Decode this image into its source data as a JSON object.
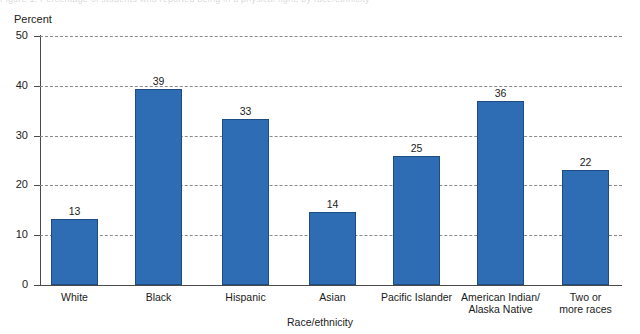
{
  "scan_artifact": {
    "text": "Figure 1.  Percentage of students who reported being in a physical fight, by race/ethnicity"
  },
  "chart_data": {
    "type": "bar",
    "title": "",
    "xlabel": "Race/ethnicity",
    "ylabel": "Percent",
    "ylim": [
      0,
      50
    ],
    "yticks": [
      0,
      10,
      20,
      30,
      40,
      50
    ],
    "ytick_labels": [
      "0",
      "10",
      "20",
      "30",
      "40",
      "50"
    ],
    "grid": "horizontal-dashed",
    "legend": "none",
    "bar_color": "#2e6db4",
    "bar_edge_color": "#1d4c82",
    "categories": [
      "White",
      "Black",
      "Hispanic",
      "Asian",
      "Pacific Islander",
      "American Indian/\nAlaska Native",
      "Two or\nmore races"
    ],
    "values": [
      13,
      39,
      33,
      14,
      25,
      36,
      22
    ],
    "data_labels": [
      "13",
      "39",
      "33",
      "14",
      "25",
      "36",
      "22"
    ],
    "bars": [
      {
        "label": "White",
        "value": 13,
        "data_label": "13",
        "plot_value": 13.2,
        "x": 51,
        "width": 47
      },
      {
        "label": "Black",
        "value": 39,
        "data_label": "39",
        "plot_value": 39.3,
        "x": 135,
        "width": 47
      },
      {
        "label": "Hispanic",
        "value": 33,
        "data_label": "33",
        "plot_value": 33.4,
        "x": 222,
        "width": 47
      },
      {
        "label": "Asian",
        "value": 14,
        "data_label": "14",
        "plot_value": 14.7,
        "x": 309,
        "width": 47
      },
      {
        "label": "Pacific Islander",
        "value": 25,
        "data_label": "25",
        "plot_value": 25.9,
        "x": 393,
        "width": 47
      },
      {
        "label": "American Indian/\nAlaska Native",
        "value": 36,
        "data_label": "36",
        "plot_value": 36.9,
        "x": 477,
        "width": 47
      },
      {
        "label": "Two or\nmore races",
        "value": 22,
        "data_label": "22",
        "plot_value": 23.1,
        "x": 562,
        "width": 47
      }
    ]
  }
}
